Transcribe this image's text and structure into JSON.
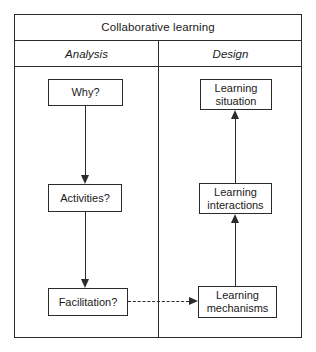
{
  "figure": {
    "title": "Collaborative learning",
    "columns": [
      {
        "label": "Analysis"
      },
      {
        "label": "Design"
      }
    ],
    "nodes": [
      {
        "id": "why",
        "label": "Why?",
        "column": "Analysis"
      },
      {
        "id": "activities",
        "label": "Activities?",
        "column": "Analysis"
      },
      {
        "id": "facilitation",
        "label": "Facilitation?",
        "column": "Analysis"
      },
      {
        "id": "situation",
        "line1": "Learning",
        "line2": "situation",
        "column": "Design"
      },
      {
        "id": "interactions",
        "line1": "Learning",
        "line2": "interactions",
        "column": "Design"
      },
      {
        "id": "mechanisms",
        "line1": "Learning",
        "line2": "mechanisms",
        "column": "Design"
      }
    ],
    "edges": [
      {
        "from": "why",
        "to": "activities",
        "style": "solid",
        "direction": "down"
      },
      {
        "from": "activities",
        "to": "facilitation",
        "style": "solid",
        "direction": "down"
      },
      {
        "from": "mechanisms",
        "to": "interactions",
        "style": "solid",
        "direction": "up"
      },
      {
        "from": "interactions",
        "to": "situation",
        "style": "solid",
        "direction": "up"
      },
      {
        "from": "facilitation",
        "to": "mechanisms",
        "style": "dashed",
        "direction": "right"
      }
    ],
    "colors": {
      "stroke": "#2b2b2b",
      "background": "#ffffff",
      "text": "#1a1a1a"
    }
  }
}
